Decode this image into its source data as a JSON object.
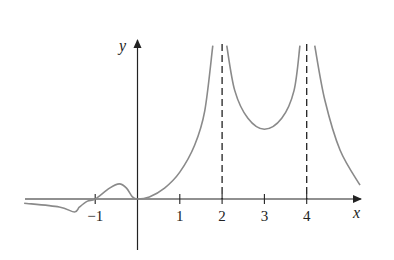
{
  "chart_data": {
    "type": "line",
    "title": "",
    "xlabel": "x",
    "ylabel": "y",
    "xlim": [
      -2.7,
      5.3
    ],
    "ylim": [
      -1.3,
      3.8
    ],
    "grid": false,
    "x_ticks": [
      -1,
      1,
      2,
      3,
      4
    ],
    "x_tick_labels": [
      "−1",
      "1",
      "2",
      "3",
      "4"
    ],
    "vertical_asymptotes": [
      2,
      4
    ],
    "line_color": "#8a8a8a",
    "axis_color": "#222222",
    "series": [
      {
        "name": "f(x) segment 1",
        "points": [
          [
            -2.68,
            -0.1
          ],
          [
            -1.85,
            -0.19
          ],
          [
            -1.49,
            -0.31
          ],
          [
            -1.37,
            -0.19
          ],
          [
            -1.18,
            -0.05
          ],
          [
            -1.0,
            0.0
          ],
          [
            -0.66,
            0.26
          ],
          [
            -0.43,
            0.36
          ],
          [
            -0.26,
            0.26
          ],
          [
            -0.12,
            0.05
          ],
          [
            0.0,
            0.0
          ],
          [
            0.28,
            0.05
          ],
          [
            0.64,
            0.26
          ],
          [
            1.0,
            0.64
          ],
          [
            1.35,
            1.28
          ],
          [
            1.59,
            2.1
          ],
          [
            1.78,
            3.65
          ]
        ]
      },
      {
        "name": "f(x) segment 2",
        "points": [
          [
            2.11,
            3.65
          ],
          [
            2.3,
            2.58
          ],
          [
            2.61,
            1.92
          ],
          [
            3.0,
            1.66
          ],
          [
            3.41,
            1.92
          ],
          [
            3.7,
            2.58
          ],
          [
            3.84,
            3.65
          ]
        ]
      },
      {
        "name": "f(x) segment 3",
        "points": [
          [
            4.19,
            3.65
          ],
          [
            4.43,
            2.35
          ],
          [
            4.79,
            1.16
          ],
          [
            5.26,
            0.33
          ]
        ]
      }
    ]
  }
}
